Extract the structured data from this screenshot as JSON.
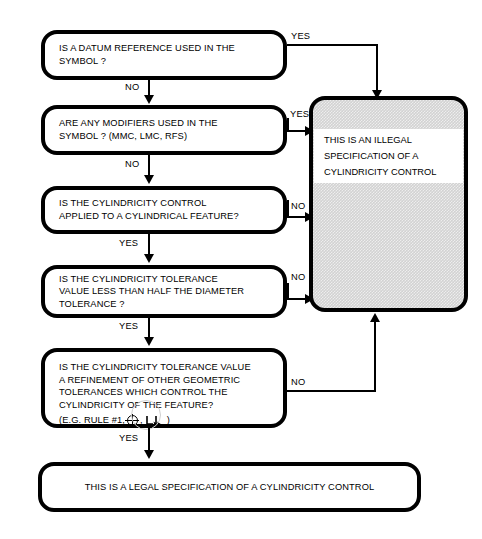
{
  "diagram": {
    "colors": {
      "stroke": "#000000",
      "box_fill": "#ffffff",
      "shaded_fill": "#d2d2d2",
      "page_background": "#ffffff"
    },
    "nodes": [
      {
        "id": "q1",
        "name": "datum-reference-question",
        "text": "IS A DATUM REFERENCE USED IN THE\nSYMBOL ?"
      },
      {
        "id": "q2",
        "name": "modifiers-question",
        "text": "ARE ANY MODIFIERS USED IN THE\nSYMBOL ? (MMC, LMC, RFS)"
      },
      {
        "id": "q3",
        "name": "cylindrical-feature-question",
        "text": "IS  THE  CYLINDRICITY  CONTROL\nAPPLIED TO A CYLINDRICAL FEATURE?"
      },
      {
        "id": "q4",
        "name": "half-diameter-tolerance-question",
        "text": "IS THE CYLINDRICITY TOLERANCE\nVALUE LESS THAN HALF THE DIAMETER\nTOLERANCE ?"
      },
      {
        "id": "q5",
        "name": "refinement-question",
        "text": "IS THE CYLINDRICITY TOLERANCE VALUE\n A  REFINEMENT OF OTHER GEOMETRIC\nTOLERANCES WHICH CONTROL THE\nCYLINDRICITY OF THE FEATURE?"
      },
      {
        "id": "q5_example",
        "name": "refinement-example-line",
        "prefix": "(E.G. RULE #1,",
        "separator": ",",
        "suffix": ")",
        "symbol_1": "position-symbol",
        "symbol_2": "total-runout-symbol"
      },
      {
        "id": "illegal",
        "name": "illegal-specification-terminal",
        "text": "THIS IS AN  ILLEGAL\nSPECIFICATION  OF A\nCYLINDRICITY  CONTROL"
      },
      {
        "id": "legal",
        "name": "legal-specification-terminal",
        "text": "THIS IS A   LEGAL  SPECIFICATION  OF A CYLINDRICITY   CONTROL"
      }
    ],
    "edge_labels": {
      "q1_yes": "YES",
      "q1_no": "NO",
      "q2_yes": "YES",
      "q2_no": "NO",
      "q3_no": "NO",
      "q3_yes": "YES",
      "q4_no": "NO",
      "q4_yes": "YES",
      "q5_no": "NO",
      "q5_yes": "YES"
    }
  }
}
